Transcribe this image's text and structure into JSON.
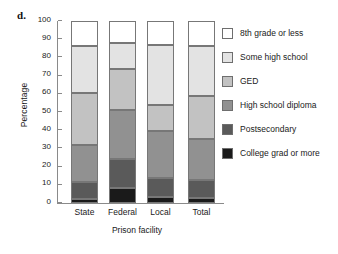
{
  "panel": {
    "letter": "d."
  },
  "chart_data": {
    "type": "bar",
    "stacked": true,
    "title": "",
    "xlabel": "Prison facility",
    "ylabel": "Percentage",
    "ylim": [
      0,
      100
    ],
    "ytick_labels": [
      "0",
      "10",
      "20",
      "30",
      "40",
      "50",
      "60",
      "70",
      "80",
      "90",
      "100"
    ],
    "ytick_values": [
      0,
      10,
      20,
      30,
      40,
      50,
      60,
      70,
      80,
      90,
      100
    ],
    "grid": false,
    "legend_position": "right",
    "categories": [
      "State",
      "Federal",
      "Local",
      "Total"
    ],
    "series": [
      {
        "name": "College grad or more",
        "color": "#1a1a1a",
        "values": [
          2.3,
          8.2,
          3.2,
          2.7
        ]
      },
      {
        "name": "Postsecondary",
        "color": "#5a5a5a",
        "values": [
          9.2,
          15.8,
          10.6,
          10.0
        ]
      },
      {
        "name": "High school diploma",
        "color": "#919191",
        "values": [
          20.5,
          27.0,
          25.7,
          22.3
        ]
      },
      {
        "name": "GED",
        "color": "#c2c2c2",
        "values": [
          28.5,
          22.5,
          14.1,
          24.0
        ]
      },
      {
        "name": "Some high school",
        "color": "#e3e3e3",
        "values": [
          25.5,
          14.5,
          33.4,
          27.5
        ]
      },
      {
        "name": "8th grade or less",
        "color": "#ffffff",
        "values": [
          14.0,
          12.0,
          13.0,
          13.5
        ]
      }
    ],
    "cumulative_boundaries": {
      "State": [
        2.3,
        11.5,
        32.0,
        60.5,
        86.0,
        100
      ],
      "Federal": [
        8.2,
        24.0,
        51.0,
        73.5,
        88.0,
        100
      ],
      "Local": [
        3.2,
        13.8,
        39.5,
        53.6,
        87.0,
        100
      ],
      "Total": [
        2.7,
        12.7,
        35.0,
        59.0,
        86.5,
        100
      ]
    }
  },
  "legend": {
    "entries": [
      {
        "label": "8th grade or less",
        "color": "#ffffff"
      },
      {
        "label": "Some high school",
        "color": "#e3e3e3"
      },
      {
        "label": "GED",
        "color": "#c2c2c2"
      },
      {
        "label": "High school diploma",
        "color": "#919191"
      },
      {
        "label": "Postsecondary",
        "color": "#5a5a5a"
      },
      {
        "label": "College grad or more",
        "color": "#1a1a1a"
      }
    ]
  }
}
